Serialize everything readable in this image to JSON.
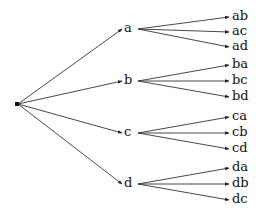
{
  "diagram": {
    "type": "tree",
    "root": {
      "label": "",
      "x": 17,
      "y": 104
    },
    "line_color": "#333333",
    "text_color": "#111111",
    "nodes": [
      {
        "label": "a",
        "x": 128,
        "y": 28,
        "children": [
          {
            "label": "ab",
            "y": 16
          },
          {
            "label": "ac",
            "y": 31
          },
          {
            "label": "ad",
            "y": 46
          }
        ]
      },
      {
        "label": "b",
        "x": 128,
        "y": 80,
        "children": [
          {
            "label": "ba",
            "y": 64
          },
          {
            "label": "bc",
            "y": 80
          },
          {
            "label": "bd",
            "y": 96
          }
        ]
      },
      {
        "label": "c",
        "x": 128,
        "y": 132,
        "children": [
          {
            "label": "ca",
            "y": 116
          },
          {
            "label": "cb",
            "y": 132
          },
          {
            "label": "cd",
            "y": 148
          }
        ]
      },
      {
        "label": "d",
        "x": 128,
        "y": 183,
        "children": [
          {
            "label": "da",
            "y": 167
          },
          {
            "label": "db",
            "y": 183
          },
          {
            "label": "dc",
            "y": 199
          }
        ]
      }
    ],
    "leaf_x": 232
  }
}
